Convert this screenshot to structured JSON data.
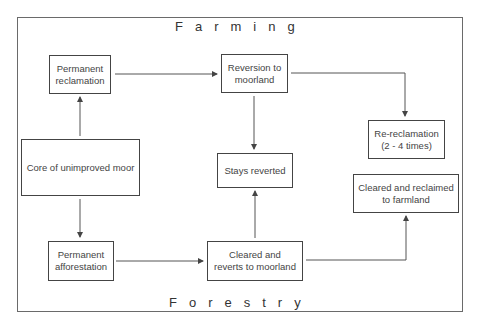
{
  "diagram": {
    "regions": {
      "top": "Farming",
      "bottom": "Forestry"
    },
    "nodes": {
      "permanent_reclamation": "Permanent\nreclamation",
      "reversion_to_moorland": "Reversion to\nmoorland",
      "re_reclamation": "Re-reclamation\n(2 - 4 times)",
      "core": "Core of unimproved moor",
      "stays_reverted": "Stays reverted",
      "cleared_reclaimed": "Cleared and reclaimed\nto farmland",
      "permanent_afforestation": "Permanent\nafforestation",
      "cleared_reverts": "Cleared and\nreverts to moorland"
    },
    "edges": [
      {
        "from": "core",
        "to": "permanent_reclamation"
      },
      {
        "from": "core",
        "to": "permanent_afforestation"
      },
      {
        "from": "permanent_reclamation",
        "to": "reversion_to_moorland"
      },
      {
        "from": "reversion_to_moorland",
        "to": "stays_reverted"
      },
      {
        "from": "reversion_to_moorland",
        "to": "re_reclamation"
      },
      {
        "from": "permanent_afforestation",
        "to": "cleared_reverts"
      },
      {
        "from": "cleared_reverts",
        "to": "stays_reverted"
      },
      {
        "from": "cleared_reverts",
        "to": "cleared_reclaimed"
      }
    ]
  }
}
